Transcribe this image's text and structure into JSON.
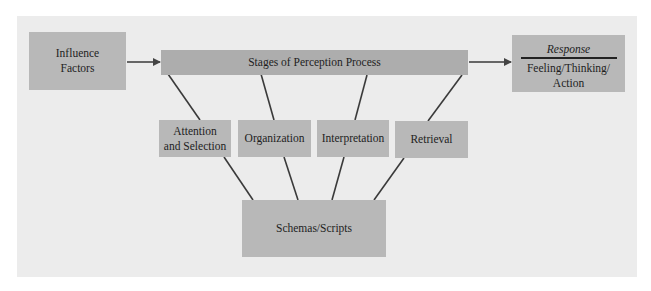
{
  "diagram": {
    "nodes": {
      "influence": {
        "label": "Influence Factors",
        "line1": "Influence",
        "line2": "Factors"
      },
      "stages": {
        "label": "Stages of Perception Process"
      },
      "response": {
        "title": "Response",
        "line1": "Feeling/Thinking/",
        "line2": "Action"
      },
      "attention": {
        "line1": "Attention",
        "line2": "and Selection"
      },
      "organization": {
        "label": "Organization"
      },
      "interpretation": {
        "label": "Interpretation"
      },
      "retrieval": {
        "label": "Retrieval"
      },
      "schemas": {
        "label": "Schemas/Scripts"
      }
    },
    "edges": [
      {
        "from": "Influence Factors",
        "to": "Stages of Perception Process",
        "type": "arrow"
      },
      {
        "from": "Stages of Perception Process",
        "to": "Response",
        "type": "arrow"
      },
      {
        "from": "Stages of Perception Process",
        "to": "Attention and Selection",
        "type": "line"
      },
      {
        "from": "Stages of Perception Process",
        "to": "Organization",
        "type": "line"
      },
      {
        "from": "Stages of Perception Process",
        "to": "Interpretation",
        "type": "line"
      },
      {
        "from": "Stages of Perception Process",
        "to": "Retrieval",
        "type": "line"
      },
      {
        "from": "Attention and Selection",
        "to": "Schemas/Scripts",
        "type": "line"
      },
      {
        "from": "Organization",
        "to": "Schemas/Scripts",
        "type": "line"
      },
      {
        "from": "Interpretation",
        "to": "Schemas/Scripts",
        "type": "line"
      },
      {
        "from": "Retrieval",
        "to": "Schemas/Scripts",
        "type": "line"
      }
    ],
    "colors": {
      "panel": "#ececec",
      "box": "#b8b8b8",
      "box_dark": "#adadad",
      "line": "#333333",
      "text": "#1e1e1e"
    }
  }
}
